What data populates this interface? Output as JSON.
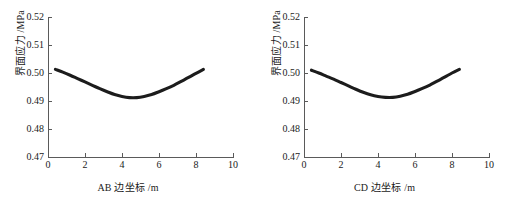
{
  "figure": {
    "panel_count": 2,
    "background_color": "#ffffff",
    "curve_color": "#1c1c1c",
    "axis_color": "#5a5a5a"
  },
  "panels": [
    {
      "id": "left",
      "xlabel_prefix": "AB",
      "xlabel_middle": "边坐标",
      "xlabel_unit": "/m",
      "xlabel_full": "AB 边坐标 /m",
      "ylabel_cn": "界面应力",
      "ylabel_unit": "/MPa",
      "ylabel_full": "界面应力 /MPa"
    },
    {
      "id": "right",
      "xlabel_prefix": "CD",
      "xlabel_middle": "边坐标",
      "xlabel_unit": "/m",
      "xlabel_full": "CD 边坐标 /m",
      "ylabel_cn": "界面应力",
      "ylabel_unit": "/MPa",
      "ylabel_full": "界面应力 /MPa"
    }
  ],
  "chart_data": [
    {
      "type": "line",
      "title": "",
      "xlabel": "AB 边坐标 /m",
      "ylabel": "界面应力 /MPa",
      "xlim": [
        0,
        10
      ],
      "ylim": [
        0.47,
        0.52
      ],
      "xticks": [
        0,
        2,
        4,
        6,
        8,
        10
      ],
      "yticks": [
        0.47,
        0.48,
        0.49,
        0.5,
        0.51,
        0.52
      ],
      "xtick_labels": [
        "0",
        "2",
        "4",
        "6",
        "8",
        "10"
      ],
      "ytick_labels": [
        "0.47",
        "0.48",
        "0.49",
        "0.50",
        "0.51",
        "0.52"
      ],
      "grid": false,
      "legend": false,
      "series": [
        {
          "name": "AB 边界面应力",
          "color": "#1c1c1c",
          "x": [
            0.4,
            0.8,
            1.2,
            1.6,
            2.0,
            2.4,
            2.8,
            3.2,
            3.6,
            4.0,
            4.4,
            4.8,
            5.2,
            5.6,
            6.0,
            6.4,
            6.8,
            7.2,
            7.6,
            8.0,
            8.4
          ],
          "y": [
            0.5013,
            0.5003,
            0.4992,
            0.498,
            0.4968,
            0.4956,
            0.4944,
            0.4933,
            0.4923,
            0.4916,
            0.4912,
            0.4912,
            0.4916,
            0.4923,
            0.4933,
            0.4944,
            0.4956,
            0.497,
            0.4984,
            0.4999,
            0.5013
          ]
        }
      ],
      "annotations": []
    },
    {
      "type": "line",
      "title": "",
      "xlabel": "CD 边坐标 /m",
      "ylabel": "界面应力 /MPa",
      "xlim": [
        0,
        10
      ],
      "ylim": [
        0.47,
        0.52
      ],
      "xticks": [
        0,
        2,
        4,
        6,
        8,
        10
      ],
      "yticks": [
        0.47,
        0.48,
        0.49,
        0.5,
        0.51,
        0.52
      ],
      "xtick_labels": [
        "0",
        "2",
        "4",
        "6",
        "8",
        "10"
      ],
      "ytick_labels": [
        "0.47",
        "0.48",
        "0.49",
        "0.50",
        "0.51",
        "0.52"
      ],
      "grid": false,
      "legend": false,
      "series": [
        {
          "name": "CD 边界面应力",
          "color": "#1c1c1c",
          "x": [
            0.4,
            0.8,
            1.2,
            1.6,
            2.0,
            2.4,
            2.8,
            3.2,
            3.6,
            4.0,
            4.4,
            4.8,
            5.2,
            5.6,
            6.0,
            6.4,
            6.8,
            7.2,
            7.6,
            8.0,
            8.4
          ],
          "y": [
            0.501,
            0.5,
            0.4989,
            0.4978,
            0.4966,
            0.4954,
            0.4942,
            0.4931,
            0.4922,
            0.4916,
            0.4913,
            0.4913,
            0.4917,
            0.4924,
            0.4934,
            0.4945,
            0.4957,
            0.4971,
            0.4985,
            0.5,
            0.5013
          ]
        }
      ],
      "annotations": []
    }
  ]
}
